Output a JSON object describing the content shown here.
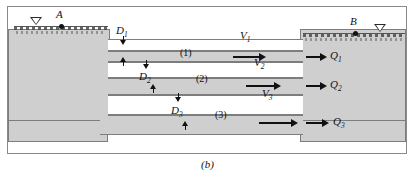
{
  "figure": {
    "caption": "(b)",
    "type": "engineering-schematic"
  },
  "points": {
    "a_label": "A",
    "b_label": "B"
  },
  "reservoirs": {
    "left": {
      "surface_symbol": "water-level-triangle"
    },
    "right": {
      "surface_symbol": "water-level-triangle"
    }
  },
  "pipes": [
    {
      "section_label": "(1)",
      "diameter_label": "D",
      "diameter_sub": "1",
      "velocity_label": "V",
      "velocity_sub": "1",
      "discharge_label": "Q",
      "discharge_sub": "1"
    },
    {
      "section_label": "(2)",
      "diameter_label": "D",
      "diameter_sub": "2",
      "velocity_label": "V",
      "velocity_sub": "2",
      "discharge_label": "Q",
      "discharge_sub": "2"
    },
    {
      "section_label": "(3)",
      "diameter_label": "D",
      "diameter_sub": "3",
      "velocity_label": "V",
      "velocity_sub": "3",
      "discharge_label": "Q",
      "discharge_sub": "3"
    }
  ],
  "colors": {
    "solid_fill": "#cfcfcf",
    "outline": "#7d7d7d",
    "ink": "#111111",
    "frame": "#8a8a8a"
  }
}
